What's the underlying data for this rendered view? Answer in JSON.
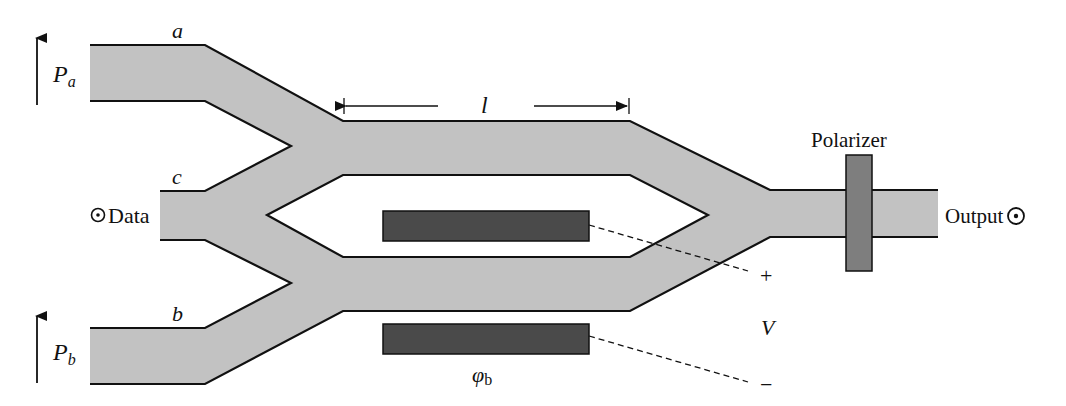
{
  "diagram": {
    "type": "integrated-optic Mach-Zehnder modulator / switch",
    "colors": {
      "waveguide_fill": "#c2c2c2",
      "waveguide_edge": "#111111",
      "electrode_fill": "#4a4a4a",
      "polarizer_fill": "#7e7e7e",
      "background": "#ffffff"
    },
    "labels": {
      "port_a": "a",
      "port_b": "b",
      "port_c": "c",
      "power_a_main": "P",
      "power_a_sub": "a",
      "power_b_main": "P",
      "power_b_sub": "b",
      "data_input": "Data",
      "length": "l",
      "polarizer": "Polarizer",
      "output": "Output",
      "voltage": "V",
      "plus": "+",
      "minus": "−",
      "phase_main": "φ",
      "phase_sub": "b"
    },
    "icons": {
      "data_symbol": "circled-dot",
      "output_symbol": "circled-dot",
      "power_arrow": "up-arrow"
    }
  }
}
